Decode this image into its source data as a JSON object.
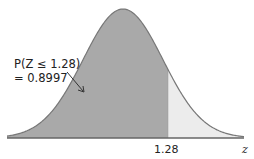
{
  "header": {
    "cut_off_text": ""
  },
  "chart_data": {
    "type": "area",
    "title": "",
    "xlabel": "z",
    "ylabel": "",
    "distribution": {
      "mean": 0,
      "sd": 1
    },
    "shaded_region": {
      "from": "-inf",
      "to": 1.28,
      "probability": 0.8997,
      "color": "#a9a9a9"
    },
    "unshaded_region": {
      "from": 1.28,
      "to": "inf",
      "color": "#ececec"
    },
    "tick_labels": [
      "1.28"
    ],
    "annotation": {
      "line1": "P(Z ≤ 1.28)",
      "line2": "= 0.8997"
    },
    "grid": false,
    "legend": null
  },
  "layout": {
    "center_x": 123,
    "baseline_y": 138,
    "peak_y": 9,
    "sigma_px": 40,
    "axis_x_start": 7,
    "axis_x_end": 244,
    "cut_x": 168,
    "curve_color": "#777777",
    "axis_color": "#666666"
  }
}
